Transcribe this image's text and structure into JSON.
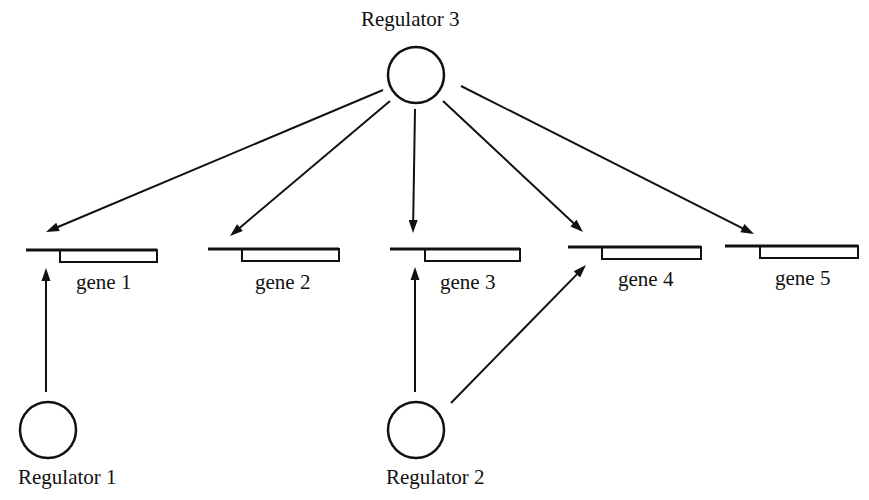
{
  "diagram": {
    "type": "gene-regulatory-network",
    "colors": {
      "stroke": "#111111",
      "background": "#ffffff",
      "fill": "#ffffff"
    },
    "regulators": [
      {
        "id": "reg1",
        "label": "Regulator 1",
        "cx": 48,
        "cy": 430,
        "r": 28,
        "label_x": 18,
        "label_y": 467
      },
      {
        "id": "reg2",
        "label": "Regulator 2",
        "cx": 416,
        "cy": 430,
        "r": 28,
        "label_x": 386,
        "label_y": 467
      },
      {
        "id": "reg3",
        "label": "Regulator 3",
        "cx": 416,
        "cy": 75,
        "r": 28,
        "label_x": 361,
        "label_y": 9
      }
    ],
    "genes": [
      {
        "id": "gene1",
        "label": "gene 1",
        "line_x1": 26,
        "box_x": 60,
        "box_w": 97,
        "y": 250,
        "h": 12,
        "label_x": 76,
        "label_y": 272
      },
      {
        "id": "gene2",
        "label": "gene 2",
        "line_x1": 208,
        "box_x": 242,
        "box_w": 97,
        "y": 249,
        "h": 12,
        "label_x": 255,
        "label_y": 272
      },
      {
        "id": "gene3",
        "label": "gene 3",
        "line_x1": 390,
        "box_x": 425,
        "box_w": 95,
        "y": 249,
        "h": 12,
        "label_x": 440,
        "label_y": 272
      },
      {
        "id": "gene4",
        "label": "gene 4",
        "line_x1": 568,
        "box_x": 602,
        "box_w": 99,
        "y": 247,
        "h": 12,
        "label_x": 618,
        "label_y": 269
      },
      {
        "id": "gene5",
        "label": "gene 5",
        "line_x1": 725,
        "box_x": 760,
        "box_w": 98,
        "y": 246,
        "h": 12,
        "label_x": 775,
        "label_y": 268
      }
    ],
    "edges": [
      {
        "from": "reg3",
        "to": "gene1",
        "x1": 383,
        "y1": 90,
        "x2": 46,
        "y2": 232
      },
      {
        "from": "reg3",
        "to": "gene2",
        "x1": 390,
        "y1": 101,
        "x2": 230,
        "y2": 236
      },
      {
        "from": "reg3",
        "to": "gene3",
        "x1": 415,
        "y1": 109,
        "x2": 413,
        "y2": 233
      },
      {
        "from": "reg3",
        "to": "gene4",
        "x1": 443,
        "y1": 101,
        "x2": 583,
        "y2": 232
      },
      {
        "from": "reg3",
        "to": "gene5",
        "x1": 461,
        "y1": 86,
        "x2": 754,
        "y2": 234
      },
      {
        "from": "reg1",
        "to": "gene1",
        "x1": 46,
        "y1": 392,
        "x2": 46,
        "y2": 268
      },
      {
        "from": "reg2",
        "to": "gene3",
        "x1": 415,
        "y1": 392,
        "x2": 415,
        "y2": 267
      },
      {
        "from": "reg2",
        "to": "gene4",
        "x1": 451,
        "y1": 403,
        "x2": 586,
        "y2": 265
      }
    ]
  }
}
